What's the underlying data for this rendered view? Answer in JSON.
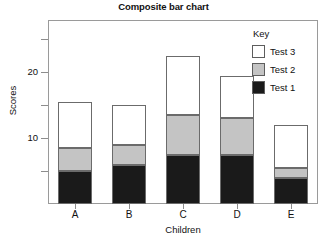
{
  "chart_data": {
    "type": "bar",
    "title": "Composite bar chart",
    "xlabel": "Children",
    "ylabel": "Scores",
    "stacked": true,
    "grid": false,
    "legend_position": "inside-top-right",
    "legend_title": "Key",
    "categories": [
      "A",
      "B",
      "C",
      "D",
      "E"
    ],
    "ylim": [
      0,
      28
    ],
    "yticks": [
      5,
      10,
      15,
      20,
      25
    ],
    "ytick_labels": [
      "",
      "10",
      "",
      "20",
      ""
    ],
    "series": [
      {
        "name": "Test 1",
        "color": "#1a1a1a",
        "values": [
          5,
          6,
          7.5,
          7.5,
          4
        ]
      },
      {
        "name": "Test 2",
        "color": "#c4c4c4",
        "values": [
          3.5,
          3,
          6,
          5.5,
          1.5
        ]
      },
      {
        "name": "Test 3",
        "color": "#ffffff",
        "values": [
          7,
          6,
          9,
          6.5,
          6.5
        ]
      }
    ],
    "totals": [
      15.5,
      15,
      22.5,
      19.5,
      12
    ]
  },
  "legend": {
    "title": "Key",
    "entries": [
      {
        "label": "Test 3",
        "swatch": "#ffffff"
      },
      {
        "label": "Test 2",
        "swatch": "#c4c4c4"
      },
      {
        "label": "Test 1",
        "swatch": "#1a1a1a"
      }
    ]
  },
  "colors": {
    "test1": "#1a1a1a",
    "test2": "#c4c4c4",
    "test3": "#ffffff",
    "axis": "#8d8d8d",
    "frame": "#9a9a9a",
    "text": "#111111",
    "background": "#ffffff"
  }
}
